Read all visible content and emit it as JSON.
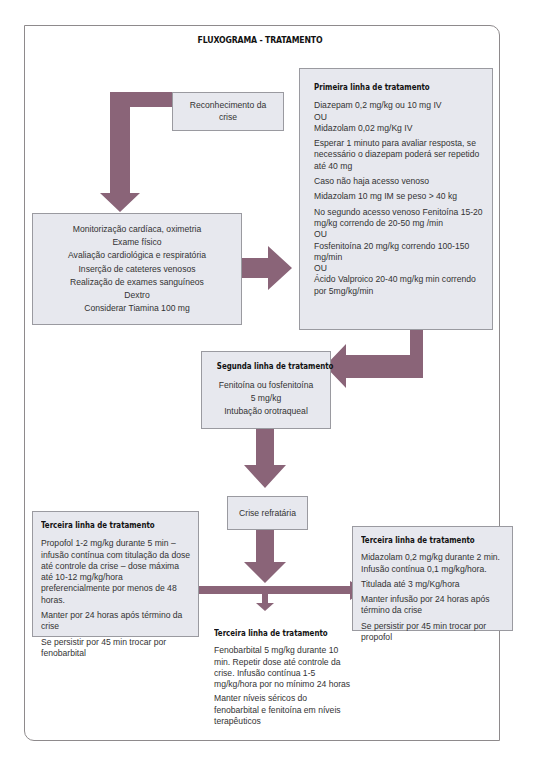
{
  "title": "FLUXOGRAMA - TRATAMENTO",
  "colors": {
    "arrow": "#8a6478",
    "box_fill": "#e7e8ee",
    "box_border": "#9a9aa0",
    "frame": "#8e8a8c"
  },
  "nodes": {
    "recognition": {
      "lines": [
        "Reconhecimento da",
        "crise"
      ]
    },
    "initial_care": {
      "lines": [
        "Monitorização cardíaca, oximetria",
        "Exame físico",
        "Avaliação cardiológica e respiratória",
        "Inserção de cateteres venosos",
        "Realização de exames sanguíneos",
        "Dextro",
        "Considerar Tiamina 100 mg"
      ]
    },
    "first_line": {
      "header": "Primeira linha de tratamento",
      "paragraphs": [
        "Diazepam 0,2 mg/kg ou 10 mg IV\nOU\nMidazolam 0,02 mg/Kg IV",
        "Esperar 1 minuto para avaliar resposta, se necessário o diazepam poderá ser repetido até 40 mg",
        "Caso não haja acesso venoso",
        "Midazolam 10 mg IM se peso > 40 kg",
        "No segundo acesso venoso Fenitoína 15-20 mg/kg correndo de 20-50 mg /min\nOU\nFosfenitoína 20 mg/kg correndo 100-150 mg/min\nOU\nÁcido Valproico 20-40 mg/kg min correndo por 5mg/kg/min"
      ]
    },
    "second_line": {
      "header": "Segunda linha de tratamento",
      "lines": [
        "Fenitoína ou fosfenitoína",
        "5 mg/kg",
        "Intubação orotraqueal"
      ]
    },
    "refractory": {
      "label": "Crise refratária"
    },
    "third_line_propofol": {
      "header": "Terceira linha de tratamento",
      "paragraphs": [
        "Propofol 1-2 mg/kg durante 5 min – infusão contínua com titulação da dose até controle da crise – dose máxima até 10-12 mg/kg/hora preferencialmente por menos de 48 horas.",
        "Manter por 24 horas após término da crise",
        "Se persistir por 45 min trocar por fenobarbital"
      ]
    },
    "third_line_midazolam": {
      "header": "Terceira linha de tratamento",
      "paragraphs": [
        "Midazolam 0,2 mg/kg durante 2 min. Infusão contínua 0,1 mg/kg/hora.",
        "Titulada até 3 mg/Kg/hora",
        "Manter infusão por 24 horas após término da crise",
        "Se persistir por 45 min trocar por propofol"
      ]
    },
    "third_line_phenobarbital": {
      "header": "Terceira linha de tratamento",
      "paragraphs": [
        "Fenobarbital 5 mg/kg durante 10 min. Repetir dose até controle da crise. Infusão contínua 1-5 mg/kg/hora por no mínimo 24 horas",
        "Manter níveis séricos do fenobarbital e fenitoína em níveis terapêuticos"
      ]
    }
  }
}
